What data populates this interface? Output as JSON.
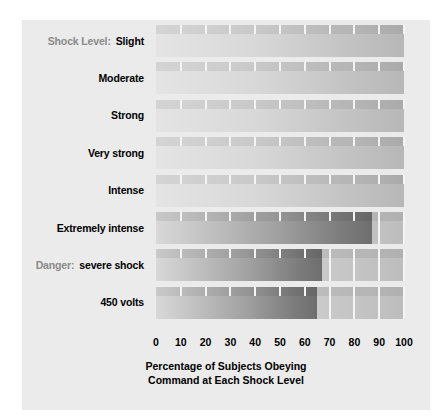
{
  "chart_data": {
    "type": "bar",
    "orientation": "horizontal",
    "title": "",
    "xlabel": "Percentage of Subjects Obeying Command at Each Shock Level",
    "xlabel_lines": [
      "Percentage of Subjects Obeying",
      "Command at Each Shock Level"
    ],
    "ylabel": "Shock Level:",
    "xlim": [
      0,
      100
    ],
    "xticks": [
      0,
      10,
      20,
      30,
      40,
      50,
      60,
      70,
      80,
      90,
      100
    ],
    "xtick_labels": [
      "0",
      "10",
      "20",
      "30",
      "40",
      "50",
      "60",
      "70",
      "80",
      "90",
      "100"
    ],
    "grid": true,
    "legend": "none",
    "categories": [
      "Slight",
      "Moderate",
      "Strong",
      "Very strong",
      "Intense",
      "Extremely intense",
      "Danger: severe shock",
      "450 volts"
    ],
    "values": [
      100,
      100,
      100,
      100,
      100,
      87,
      67,
      65
    ],
    "series": [
      {
        "name": "Percentage of Subjects Obeying",
        "values": [
          100,
          100,
          100,
          100,
          100,
          87,
          67,
          65
        ]
      }
    ]
  },
  "panel": {
    "background_color": "#ebebeb",
    "bar_color_light": "#d8d8d8",
    "bar_color_dark": "#6e6e6e",
    "gridline_color": "#f4f4f4",
    "prefix_color": "#8a8a8a"
  },
  "rows": [
    {
      "prefix": "Shock Level:",
      "label": "Slight",
      "value": 100
    },
    {
      "prefix": "",
      "label": "Moderate",
      "value": 100
    },
    {
      "prefix": "",
      "label": "Strong",
      "value": 100
    },
    {
      "prefix": "",
      "label": "Very strong",
      "value": 100
    },
    {
      "prefix": "",
      "label": "Intense",
      "value": 100
    },
    {
      "prefix": "",
      "label": "Extremely intense",
      "value": 87
    },
    {
      "prefix": "Danger:",
      "label": "severe shock",
      "value": 67
    },
    {
      "prefix": "",
      "label": "450 volts",
      "value": 65
    }
  ],
  "axis": {
    "ticks": [
      "0",
      "10",
      "20",
      "30",
      "40",
      "50",
      "60",
      "70",
      "80",
      "90",
      "100"
    ],
    "title_line1": "Percentage of Subjects Obeying",
    "title_line2": "Command at Each Shock Level"
  }
}
